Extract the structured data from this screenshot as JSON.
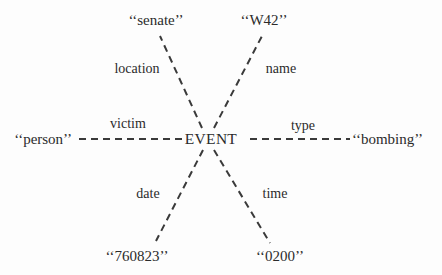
{
  "diagram": {
    "type": "semantic-network",
    "center": {
      "label": "EVENT",
      "x": 211,
      "y": 139
    },
    "colors": {
      "background": "#fdfdfd",
      "ink": "#2b2b2b",
      "edge": "#3a3a3a"
    },
    "edges": [
      {
        "id": "location",
        "relation": "location",
        "value": "‘‘senate’’",
        "relation_x": 137,
        "relation_y": 69,
        "relation_anchor": "center",
        "value_x": 156,
        "value_y": 20,
        "value_anchor": "center",
        "style": "dashed",
        "from_x": 202,
        "from_y": 128,
        "to_x": 160,
        "to_y": 36
      },
      {
        "id": "name",
        "relation": "name",
        "value": "‘‘W42’’",
        "relation_x": 281,
        "relation_y": 69,
        "relation_anchor": "center",
        "value_x": 264,
        "value_y": 20,
        "value_anchor": "center",
        "style": "dashed",
        "from_x": 214,
        "from_y": 128,
        "to_x": 262,
        "to_y": 36
      },
      {
        "id": "victim",
        "relation": "victim",
        "value": "‘‘person’’",
        "relation_x": 128,
        "relation_y": 124,
        "relation_anchor": "center",
        "value_x": 72,
        "value_y": 139,
        "value_anchor": "right",
        "style": "dashed",
        "from_x": 182,
        "from_y": 139,
        "to_x": 76,
        "to_y": 139
      },
      {
        "id": "type",
        "relation": "type",
        "value": "‘‘bombing’’",
        "relation_x": 303,
        "relation_y": 126,
        "relation_anchor": "center",
        "value_x": 352,
        "value_y": 139,
        "value_anchor": "left",
        "style": "dashed",
        "from_x": 250,
        "from_y": 139,
        "to_x": 350,
        "to_y": 139
      },
      {
        "id": "date",
        "relation": "date",
        "value": "‘‘760823’’",
        "relation_x": 148,
        "relation_y": 194,
        "relation_anchor": "center",
        "value_x": 137,
        "value_y": 256,
        "value_anchor": "center",
        "style": "dashed",
        "from_x": 203,
        "from_y": 150,
        "to_x": 156,
        "to_y": 241
      },
      {
        "id": "time",
        "relation": "time",
        "value": "‘‘0200’’",
        "relation_x": 275,
        "relation_y": 194,
        "relation_anchor": "center",
        "value_x": 280,
        "value_y": 256,
        "value_anchor": "center",
        "style": "dashed",
        "from_x": 214,
        "from_y": 150,
        "to_x": 270,
        "to_y": 243
      }
    ]
  }
}
